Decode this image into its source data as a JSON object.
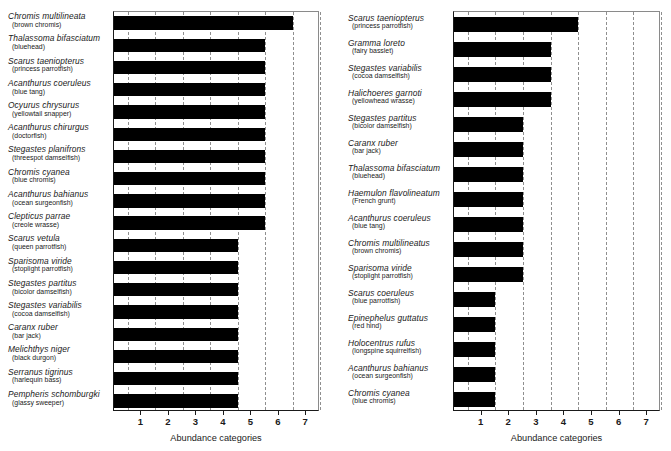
{
  "chart_data": [
    {
      "panel": "left",
      "type": "bar",
      "orientation": "horizontal",
      "title": "",
      "xlabel": "Abundance categories",
      "ylabel": "",
      "xlim": [
        0,
        7.5
      ],
      "xticks": [
        1,
        2,
        3,
        4,
        5,
        6,
        7
      ],
      "grid": "dashed-vertical-at-half-units",
      "bar_color": "#000000",
      "categories": [
        "Chromis multilineata",
        "Thalassoma bifasciatum",
        "Scarus taeniopterus",
        "Acanthurus coeruleus",
        "Ocyurus chrysurus",
        "Acanthurus chirurgus",
        "Stegastes planifrons",
        "Chromis cyanea",
        "Acanthurus bahianus",
        "Clepticus parrae",
        "Scarus vetula",
        "Sparisoma viride",
        "Stegastes partitus",
        "Stegastes variabilis",
        "Caranx ruber",
        "Melichthys niger",
        "Serranus tigrinus",
        "Pempheris schomburgki"
      ],
      "common_names": [
        "(brown chromis)",
        "(bluehead)",
        "(princess parrotfish)",
        "(blue tang)",
        "(yellowtail snapper)",
        "(doctorfish)",
        "(threespot damselfish)",
        "(blue chromis)",
        "(ocean surgeonfish)",
        "(creole wrasse)",
        "(queen parrotfish)",
        "(stoplight parrotfish)",
        "(bicolor damselfish)",
        "(cocoa damselfish)",
        "(bar jack)",
        "(black durgon)",
        "(harlequin bass)",
        "(glassy sweeper)"
      ],
      "values": [
        6.5,
        5.5,
        5.5,
        5.5,
        5.5,
        5.5,
        5.5,
        5.5,
        5.5,
        5.5,
        4.5,
        4.5,
        4.5,
        4.5,
        4.5,
        4.5,
        4.5,
        4.5
      ]
    },
    {
      "panel": "right",
      "type": "bar",
      "orientation": "horizontal",
      "title": "",
      "xlabel": "Abundance categories",
      "ylabel": "",
      "xlim": [
        0,
        7.5
      ],
      "xticks": [
        1,
        2,
        3,
        4,
        5,
        6,
        7
      ],
      "grid": "dashed-vertical-at-half-units",
      "bar_color": "#000000",
      "categories": [
        "Scarus taeniopterus",
        "Gramma loreto",
        "Stegastes variabilis",
        "Halichoeres garnoti",
        "Stegastes partitus",
        "Caranx ruber",
        "Thalassoma bifasciatum",
        "Haemulon flavolineatum",
        "Acanthurus coeruleus",
        "Chromis multilineatus",
        "Sparisoma viride",
        "Scarus coeruleus",
        "Epinephelus guttatus",
        "Holocentrus rufus",
        "Acanthurus bahianus",
        "Chromis cyanea"
      ],
      "common_names": [
        "(princess parrotfish)",
        "(fairy basslet)",
        "(cocoa damselfish)",
        "(yellowhead wrasse)",
        "(bicolor damselfish)",
        "(bar jack)",
        "(bluehead)",
        "(French grunt)",
        "(blue tang)",
        "(brown chromis)",
        "(stoplight parrotfish)",
        "(blue parrotfish)",
        "(red hind)",
        "(longspine squirrelfish)",
        "(ocean surgeonfish)",
        "(blue chromis)"
      ],
      "values": [
        4.5,
        3.5,
        3.5,
        3.5,
        2.5,
        2.5,
        2.5,
        2.5,
        2.5,
        2.5,
        2.5,
        1.5,
        1.5,
        1.5,
        1.5,
        1.5
      ]
    }
  ]
}
